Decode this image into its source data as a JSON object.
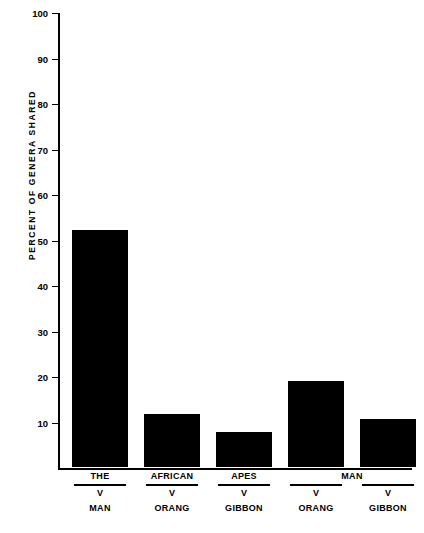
{
  "chart_data": {
    "type": "bar",
    "title": "",
    "xlabel": "",
    "ylabel": "PERCENT  OF  GENERA  SHARED",
    "ylim": [
      0,
      100
    ],
    "ytick_labels": [
      "100",
      "90",
      "80",
      "70",
      "60",
      "50",
      "40",
      "30",
      "20",
      "10"
    ],
    "ytick_values": [
      100,
      90,
      80,
      70,
      60,
      50,
      40,
      30,
      20,
      10
    ],
    "grid": false,
    "legend": null,
    "bar_color": "#000000",
    "axis_color": "#000000",
    "categories": [
      "THE / V / MAN",
      "AFRICAN / V / ORANG",
      "APES / V / GIBBON",
      "MAN / V / ORANG",
      "MAN / V / GIBBON"
    ],
    "values": [
      52,
      11.6,
      7.7,
      18.8,
      10.5
    ],
    "groups": [
      {
        "numerator": "THE",
        "divider": "V",
        "denominator": "MAN",
        "value": 52
      },
      {
        "numerator": "AFRICAN",
        "divider": "V",
        "denominator": "ORANG",
        "value": 11.6
      },
      {
        "numerator": "APES",
        "divider": "V",
        "denominator": "GIBBON",
        "value": 7.7
      },
      {
        "numerator": "",
        "divider": "V",
        "denominator": "ORANG",
        "value": 18.8
      },
      {
        "numerator": "",
        "divider": "V",
        "denominator": "GIBBON",
        "value": 10.5
      }
    ],
    "spanning_numerators": [
      {
        "text": "MAN",
        "covers_groups": [
          4,
          5
        ]
      }
    ],
    "annotations": []
  }
}
